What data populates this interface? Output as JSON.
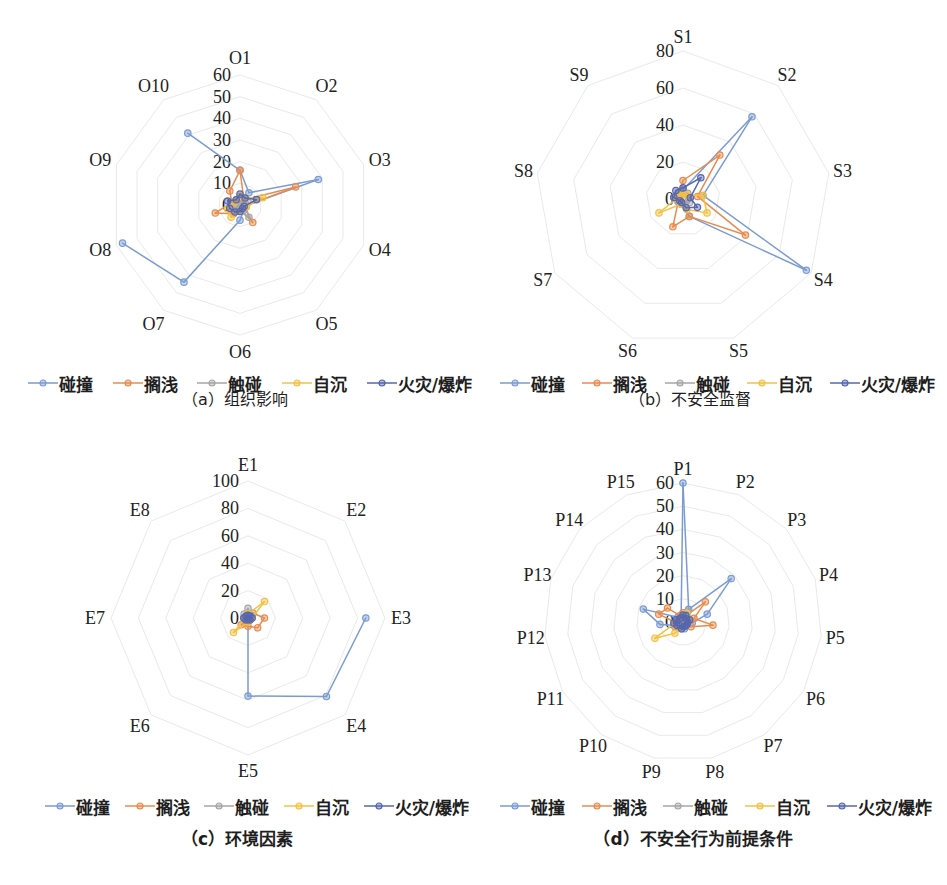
{
  "legend": {
    "items": [
      {
        "label": "碰撞",
        "color": "#7B9BD2"
      },
      {
        "label": "搁浅",
        "color": "#E88B4E"
      },
      {
        "label": "触碰",
        "color": "#A6A6A6"
      },
      {
        "label": "自沉",
        "color": "#F4C143"
      },
      {
        "label": "火灾/爆炸",
        "color": "#5666B0"
      }
    ]
  },
  "panels": [
    {
      "caption": "（a）组织影响"
    },
    {
      "caption": "（b）不安全监督"
    },
    {
      "caption": "（c）环境因素"
    },
    {
      "caption": "（d）不安全行为前提条件"
    }
  ],
  "chart_data": [
    {
      "type": "radar",
      "title": "（a）组织影响",
      "axes": [
        "O1",
        "O2",
        "O3",
        "O4",
        "O5",
        "O6",
        "O7",
        "O8",
        "O9",
        "O10"
      ],
      "ticks": [
        0,
        10,
        20,
        30,
        40,
        50,
        60
      ],
      "rmax": 60,
      "grid": true,
      "legend_position": "bottom",
      "series": [
        {
          "name": "碰撞",
          "values": [
            16,
            7,
            38,
            2,
            3,
            7,
            44,
            57,
            null,
            41
          ]
        },
        {
          "name": "搁浅",
          "values": [
            16,
            3,
            27,
            2,
            10,
            2,
            5,
            12,
            4,
            8
          ]
        },
        {
          "name": "触碰",
          "values": [
            3,
            2,
            4,
            3,
            7,
            3,
            2,
            3,
            2,
            2
          ]
        },
        {
          "name": "自沉",
          "values": [
            4,
            4,
            11,
            3,
            2,
            3,
            7,
            6,
            3,
            3
          ]
        },
        {
          "name": "火灾/爆炸",
          "values": [
            5,
            4,
            8,
            2,
            2,
            3,
            4,
            5,
            6,
            3
          ]
        }
      ]
    },
    {
      "type": "radar",
      "title": "（b）不安全监督",
      "axes": [
        "S1",
        "S2",
        "S3",
        "S4",
        "S5",
        "S6",
        "S7",
        "S8",
        "S9"
      ],
      "ticks": [
        0,
        20,
        40,
        60,
        80
      ],
      "rmax": 80,
      "grid": true,
      "legend_position": "bottom",
      "series": [
        {
          "name": "碰撞",
          "values": [
            5,
            58,
            11,
            77,
            10,
            3,
            2,
            3,
            4
          ]
        },
        {
          "name": "搁浅",
          "values": [
            10,
            31,
            8,
            39,
            10,
            16,
            3,
            2,
            3
          ]
        },
        {
          "name": "触碰",
          "values": [
            3,
            4,
            3,
            4,
            3,
            2,
            3,
            5,
            2
          ]
        },
        {
          "name": "自沉",
          "values": [
            2,
            3,
            11,
            15,
            6,
            3,
            15,
            3,
            2
          ]
        },
        {
          "name": "火灾/爆炸",
          "values": [
            6,
            15,
            4,
            9,
            5,
            2,
            2,
            5,
            6
          ]
        }
      ]
    },
    {
      "type": "radar",
      "title": "（c）环境因素",
      "axes": [
        "E1",
        "E2",
        "E3",
        "E4",
        "E5",
        "E6",
        "E7",
        "E8"
      ],
      "ticks": [
        0,
        20,
        40,
        60,
        80,
        100
      ],
      "rmax": 100,
      "grid": true,
      "legend_position": "bottom",
      "series": [
        {
          "name": "碰撞",
          "values": [
            2,
            null,
            86,
            81,
            57,
            0,
            0,
            1
          ]
        },
        {
          "name": "搁浅",
          "values": [
            3,
            5,
            12,
            10,
            6,
            7,
            3,
            2
          ]
        },
        {
          "name": "触碰",
          "values": [
            7,
            3,
            3,
            2,
            2,
            3,
            3,
            4
          ]
        },
        {
          "name": "自沉",
          "values": [
            3,
            17,
            3,
            2,
            3,
            15,
            2,
            2
          ]
        },
        {
          "name": "火灾/爆炸",
          "values": [
            2,
            2,
            3,
            2,
            1,
            2,
            3,
            2
          ]
        }
      ]
    },
    {
      "type": "radar",
      "title": "（d）不安全行为前提条件",
      "axes": [
        "P1",
        "P2",
        "P3",
        "P4",
        "P5",
        "P6",
        "P7",
        "P8",
        "P9",
        "P10",
        "P11",
        "P12",
        "P13",
        "P14",
        "P15"
      ],
      "ticks": [
        0,
        10,
        20,
        30,
        40,
        50,
        60
      ],
      "rmax": 60,
      "grid": true,
      "legend_position": "bottom",
      "series": [
        {
          "name": "碰撞",
          "values": [
            60,
            6,
            28,
            11,
            4,
            2,
            2,
            3,
            3,
            2,
            3,
            10,
            18,
            3,
            2
          ]
        },
        {
          "name": "搁浅",
          "values": [
            4,
            3,
            13,
            5,
            13,
            4,
            2,
            2,
            2,
            3,
            4,
            3,
            11,
            9,
            3
          ]
        },
        {
          "name": "触碰",
          "values": [
            3,
            5,
            3,
            2,
            2,
            2,
            1,
            2,
            2,
            2,
            3,
            2,
            2,
            2,
            2
          ]
        },
        {
          "name": "自沉",
          "values": [
            3,
            4,
            3,
            2,
            2,
            2,
            1,
            2,
            2,
            6,
            14,
            3,
            2,
            2,
            2
          ]
        },
        {
          "name": "火灾/爆炸",
          "values": [
            3,
            3,
            2,
            3,
            2,
            2,
            2,
            2,
            3,
            2,
            3,
            4,
            3,
            2,
            2
          ]
        }
      ]
    }
  ]
}
